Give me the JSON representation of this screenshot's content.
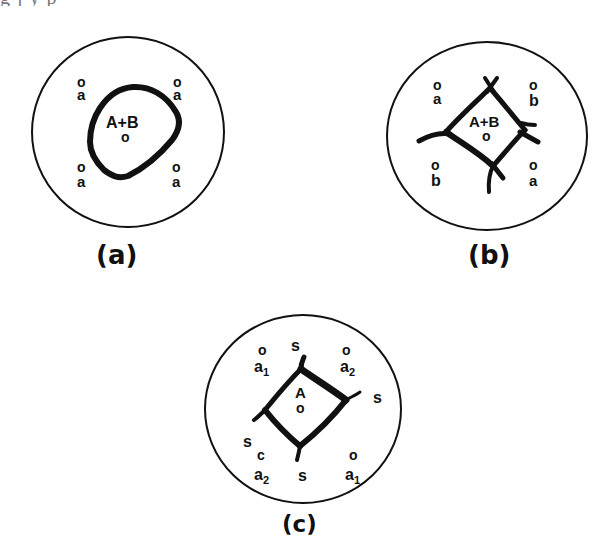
{
  "header_fragment": "g      j        y                          p",
  "panels": [
    {
      "id": "a",
      "caption": "(a)",
      "center_label": "A+B",
      "center_marker": "o",
      "corner_labels": [
        {
          "position": "top-left",
          "marker": "o",
          "label": "a"
        },
        {
          "position": "top-right",
          "marker": "o",
          "label": "a"
        },
        {
          "position": "bottom-left",
          "marker": "o",
          "label": "a"
        },
        {
          "position": "bottom-right",
          "marker": "o",
          "label": "a"
        }
      ],
      "boundary": "rounded-closed-loop"
    },
    {
      "id": "b",
      "caption": "(b)",
      "center_label": "A+B",
      "center_marker": "o",
      "corner_labels": [
        {
          "position": "top-left",
          "marker": "o",
          "label": "a"
        },
        {
          "position": "top-right",
          "marker": "o",
          "label": "b"
        },
        {
          "position": "bottom-left",
          "marker": "o",
          "label": "b"
        },
        {
          "position": "bottom-right",
          "marker": "o",
          "label": "a"
        }
      ],
      "boundary": "diamond-with-crossing-lines"
    },
    {
      "id": "c",
      "caption": "(c)",
      "center_label": "A",
      "center_marker": "o",
      "corner_labels": [
        {
          "position": "top-left",
          "marker": "o",
          "label": "a",
          "subscript": "1"
        },
        {
          "position": "top",
          "marker": "",
          "label": "s"
        },
        {
          "position": "top-right",
          "marker": "o",
          "label": "a",
          "subscript": "2"
        },
        {
          "position": "right",
          "marker": "",
          "label": "s"
        },
        {
          "position": "left",
          "marker": "",
          "label": "s"
        },
        {
          "position": "bottom-left",
          "marker": "c",
          "label": "a",
          "subscript": "2"
        },
        {
          "position": "bottom",
          "marker": "",
          "label": "s"
        },
        {
          "position": "bottom-right",
          "marker": "o",
          "label": "a",
          "subscript": "1"
        }
      ],
      "boundary": "square-with-extended-corners"
    }
  ]
}
